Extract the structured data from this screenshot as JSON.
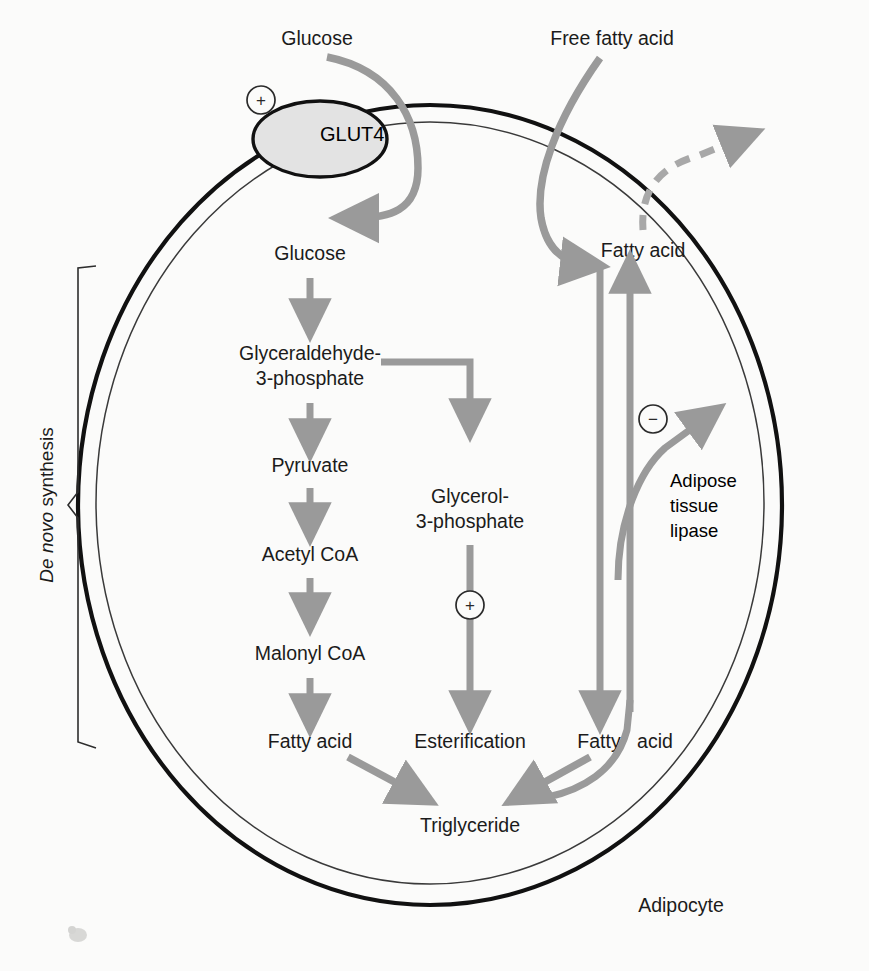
{
  "figure": {
    "cell_label": "Adipocyte",
    "bracket_label_italic": "De novo",
    "bracket_label_rest": " synthesis"
  },
  "colors": {
    "background": "#fbfbfa",
    "membrane_outer": "#111111",
    "membrane_inner": "#3a3a3a",
    "arrow_gray": "#9a9a9a",
    "glut4_fill": "#e3e3e3",
    "glut4_stroke": "#111111",
    "text": "#1b1b1b"
  },
  "external": {
    "glucose": "Glucose",
    "free_fatty_acid": "Free fatty acid"
  },
  "transporter": {
    "name": "GLUT4",
    "modifier": "+"
  },
  "pathway_main": [
    "Glucose",
    "Glyceraldehyde-",
    "3-phosphate",
    "Pyruvate",
    "Acetyl CoA",
    "Malonyl CoA",
    "Fatty acid"
  ],
  "nodes": {
    "glucose_in": "Glucose",
    "ga3p_line1": "Glyceraldehyde-",
    "ga3p_line2": "3-phosphate",
    "pyruvate": "Pyruvate",
    "acetyl_coa": "Acetyl CoA",
    "malonyl_coa": "Malonyl CoA",
    "fatty_acid_left": "Fatty acid",
    "g3p_line1": "Glycerol-",
    "g3p_line2": "3-phosphate",
    "esterification": "Esterification",
    "fatty_acid_right_top": "Fatty acid",
    "fatty_acid_right_bottom_a": "Fatty",
    "fatty_acid_right_bottom_b": "acid",
    "triglyceride": "Triglyceride",
    "lipase_line1": "Adipose",
    "lipase_line2": "tissue",
    "lipase_line3": "lipase"
  },
  "modifiers": {
    "glut4_plus": "+",
    "esterification_plus": "+",
    "lipase_minus": "−"
  }
}
